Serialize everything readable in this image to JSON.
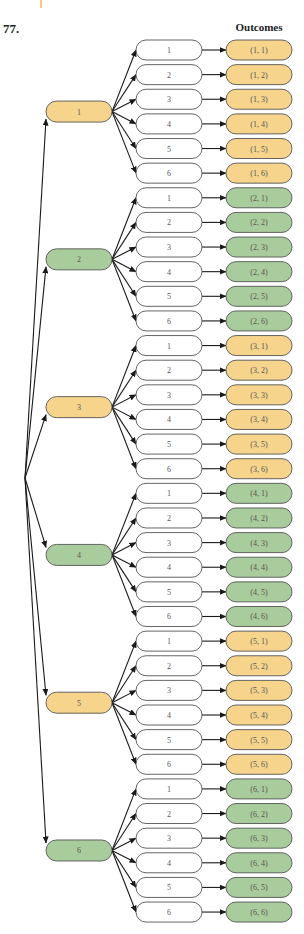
{
  "problem_number": "77.",
  "outcomes_header": "Outcomes",
  "colors": {
    "orange": "#f6d48c",
    "green": "#a9cc9c",
    "white": "#ffffff",
    "stroke": "#555555",
    "arrow": "#1a1a1a"
  },
  "first_stage": [
    {
      "label": "1",
      "color": "orange"
    },
    {
      "label": "2",
      "color": "green"
    },
    {
      "label": "3",
      "color": "orange"
    },
    {
      "label": "4",
      "color": "green"
    },
    {
      "label": "5",
      "color": "orange"
    },
    {
      "label": "6",
      "color": "green"
    }
  ],
  "second_stage_labels": [
    "1",
    "2",
    "3",
    "4",
    "5",
    "6"
  ],
  "outcomes": [
    [
      "(1, 1)",
      "(1, 2)",
      "(1, 3)",
      "(1, 4)",
      "(1, 5)",
      "(1, 6)"
    ],
    [
      "(2, 1)",
      "(2, 2)",
      "(2, 3)",
      "(2, 4)",
      "(2, 5)",
      "(2, 6)"
    ],
    [
      "(3, 1)",
      "(3, 2)",
      "(3, 3)",
      "(3, 4)",
      "(3, 5)",
      "(3, 6)"
    ],
    [
      "(4, 1)",
      "(4, 2)",
      "(4, 3)",
      "(4, 4)",
      "(4, 5)",
      "(4, 6)"
    ],
    [
      "(5, 1)",
      "(5, 2)",
      "(5, 3)",
      "(5, 4)",
      "(5, 5)",
      "(5, 6)"
    ],
    [
      "(6, 1)",
      "(6, 2)",
      "(6, 3)",
      "(6, 4)",
      "(6, 5)",
      "(6, 6)"
    ]
  ]
}
